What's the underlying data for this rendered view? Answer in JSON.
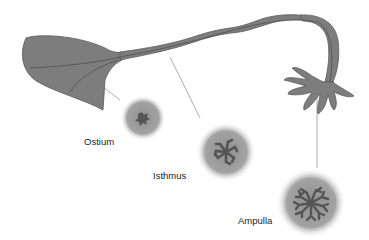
{
  "diagram": {
    "type": "anatomical illustration",
    "colors": {
      "tube": "#7d7d7d",
      "tube_outline": "#555555",
      "section_halo": "#9a9a9a",
      "mucosa": "#555555",
      "leader_line": "#777777",
      "text": "#222222"
    },
    "labels": [
      {
        "id": "ostium",
        "text": "Ostium"
      },
      {
        "id": "isthmus",
        "text": "Isthmus"
      },
      {
        "id": "ampulla",
        "text": "Ampulla"
      }
    ]
  }
}
